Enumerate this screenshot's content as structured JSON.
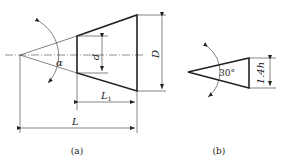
{
  "figure_a": {
    "caption": "(a)",
    "labels": {
      "angle": "α",
      "small_diameter": "d",
      "large_diameter": "D",
      "partial_length": "L",
      "partial_length_sub": "1",
      "total_length": "L"
    }
  },
  "figure_b": {
    "caption": "(b)",
    "labels": {
      "angle": "30°",
      "height": "1.4h"
    }
  }
}
